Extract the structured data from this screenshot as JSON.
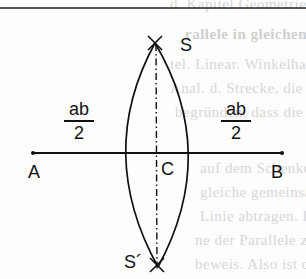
{
  "background_bleed_lines": [
    {
      "text": "d. Kapitel Geometrie",
      "y": -4,
      "bold": false
    },
    {
      "text": "rallele in gleichem Abstand",
      "y": 26,
      "bold": true
    },
    {
      "text": "tel. Linear. Winkelhalbierende",
      "y": 58,
      "bold": false
    },
    {
      "text": "Anal. d. Strecke, die schneiden",
      "y": 82,
      "bold": false
    },
    {
      "text": "begründen, dass die Gerade",
      "y": 106,
      "bold": false
    },
    {
      "text": "auf dem Schenkel",
      "y": 158,
      "bold": false
    },
    {
      "text": "gleiche gemeinsame Mitte",
      "y": 186,
      "bold": false
    },
    {
      "text": "Linie abtragen. Die Rolle",
      "y": 210,
      "bold": false
    },
    {
      "text": "ne der Parallele zur Strecke",
      "y": 234,
      "bold": false
    },
    {
      "text": "beweis. Also ist die Mittelsenkrechte",
      "y": 258,
      "bold": false
    }
  ],
  "diagram": {
    "points": {
      "A": {
        "label": "A",
        "x": 33,
        "y": 153
      },
      "B": {
        "label": "B",
        "x": 282,
        "y": 153
      },
      "C": {
        "label": "C",
        "x": 157,
        "y": 153
      },
      "S": {
        "label": "S",
        "x": 155,
        "y": 44
      },
      "S_prime": {
        "label": "S´",
        "x": 157,
        "y": 264
      }
    },
    "left_radius_label": {
      "numerator": "ab",
      "denominator": "2"
    },
    "right_radius_label": {
      "numerator": "ab",
      "denominator": "2"
    },
    "line_color": "#111111",
    "background_text_color": "#d6d6d6"
  }
}
